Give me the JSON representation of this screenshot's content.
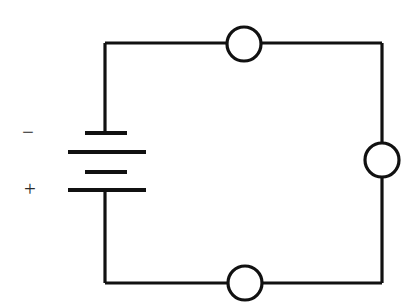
{
  "figure": {
    "type": "schematic-circuit-diagram",
    "background_color": "#ffffff",
    "line_color": "#111111",
    "width": 410,
    "height": 306
  },
  "circuit": {
    "loop": {
      "name": "series-loop",
      "left_x": 105,
      "right_x": 382,
      "top_y": 43,
      "bottom_y": 283,
      "stroke_width": 3.2
    },
    "battery": {
      "name": "battery",
      "symbol": "multi-cell-battery",
      "cell_count": 2,
      "orientation": "vertical",
      "axis_x": 105,
      "negative_label": "−",
      "positive_label": "+",
      "negative_label_x": 28,
      "negative_label_y": 134,
      "positive_label_x": 30,
      "positive_label_y": 191,
      "plates": [
        {
          "name": "plate-negative-short",
          "polarity": "negative",
          "length": "short",
          "x1": 85,
          "x2": 127,
          "y": 133
        },
        {
          "name": "plate-long-1",
          "polarity": "positive",
          "length": "long",
          "x1": 68,
          "x2": 146,
          "y": 152
        },
        {
          "name": "plate-short-2",
          "polarity": "negative",
          "length": "short",
          "x1": 85,
          "x2": 127,
          "y": 172
        },
        {
          "name": "plate-positive-long",
          "polarity": "positive",
          "length": "long",
          "x1": 68,
          "x2": 146,
          "y": 190
        }
      ]
    },
    "lamps": [
      {
        "name": "lamp-top",
        "position": "top-branch",
        "cx": 244,
        "cy": 44,
        "r": 17
      },
      {
        "name": "lamp-right",
        "position": "right-branch",
        "cx": 382,
        "cy": 160,
        "r": 17
      },
      {
        "name": "lamp-bottom",
        "position": "bottom-branch",
        "cx": 245,
        "cy": 283,
        "r": 17
      }
    ],
    "wires": [
      {
        "name": "wire-top-left",
        "x1": 105,
        "y1": 43,
        "x2": 227,
        "y2": 43
      },
      {
        "name": "wire-top-right",
        "x1": 261,
        "y1": 43,
        "x2": 382,
        "y2": 43
      },
      {
        "name": "wire-right-upper",
        "x1": 382,
        "y1": 43,
        "x2": 382,
        "y2": 143
      },
      {
        "name": "wire-right-lower",
        "x1": 382,
        "y1": 177,
        "x2": 382,
        "y2": 283
      },
      {
        "name": "wire-bottom-right",
        "x1": 382,
        "y1": 283,
        "x2": 262,
        "y2": 283
      },
      {
        "name": "wire-bottom-left",
        "x1": 228,
        "y1": 283,
        "x2": 105,
        "y2": 283
      },
      {
        "name": "wire-left-upper",
        "x1": 105,
        "y1": 43,
        "x2": 105,
        "y2": 133
      },
      {
        "name": "wire-left-lower",
        "x1": 105,
        "y1": 190,
        "x2": 105,
        "y2": 283
      }
    ]
  }
}
